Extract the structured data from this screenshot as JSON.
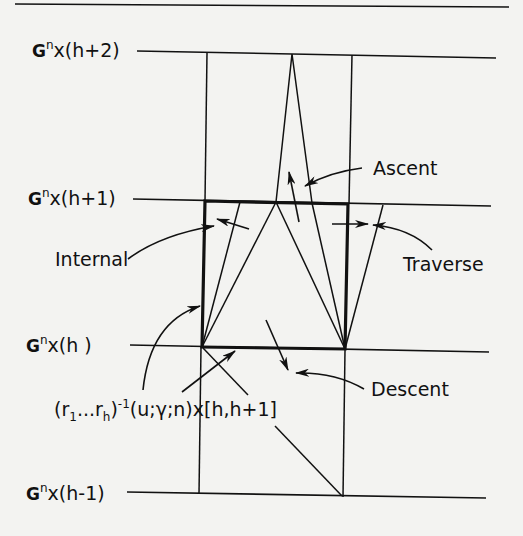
{
  "diagram": {
    "type": "cell-structure-diagram",
    "levels": [
      {
        "id": "h+2",
        "prefix": "G",
        "superscript": "n",
        "suffix": "x(h+2)"
      },
      {
        "id": "h+1",
        "prefix": "G",
        "superscript": "n",
        "suffix": "x(h+1)"
      },
      {
        "id": "h",
        "prefix": "G",
        "superscript": "n",
        "suffix": "x(h )"
      },
      {
        "id": "h-1",
        "prefix": "G",
        "superscript": "n",
        "suffix": "x(h-1)"
      }
    ],
    "annotations": {
      "ascent": "Ascent",
      "internal": "Internal",
      "traverse": "Traverse",
      "descent": "Descent"
    },
    "cell_label": {
      "part1": "(r",
      "sub1": "1",
      "part2": "...r",
      "sub2": "h",
      "part3": ")",
      "sup": "-1",
      "part4": "(u;γ;n)x[h,h+1]"
    },
    "colors": {
      "background": "#f3f3f1",
      "ink": "#111111"
    }
  }
}
